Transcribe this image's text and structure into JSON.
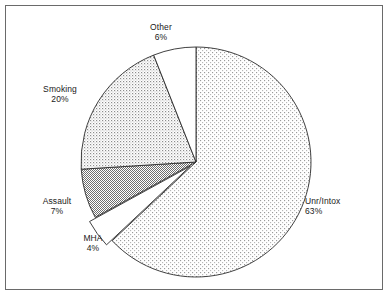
{
  "chart_data": {
    "type": "pie",
    "title": "",
    "subtitle": "",
    "xlabel": "",
    "ylabel": "",
    "legend_position": "none",
    "grid": false,
    "value_unit": "percent",
    "total": 100,
    "start_angle_deg": 0,
    "direction": "clockwise",
    "categories": [
      "Unr/Intox",
      "MHA",
      "Assault",
      "Smoking",
      "Other"
    ],
    "values": [
      63,
      4,
      7,
      20,
      6
    ],
    "slices": [
      {
        "label": "Unr/Intox",
        "value": 63,
        "value_text": "63%",
        "fill": "light-dot-stipple",
        "fill_color": "#ffffff",
        "pattern_color": "#8d8d8d",
        "exploded": false,
        "start_deg": 0,
        "end_deg": 226.8,
        "label_x": 305,
        "label_y": 196,
        "label_align": "left"
      },
      {
        "label": "MHA",
        "value": 4,
        "value_text": "4%",
        "fill": "solid-white",
        "fill_color": "#ffffff",
        "pattern_color": "#000000",
        "exploded": true,
        "explode_offset": 7,
        "start_deg": 226.8,
        "end_deg": 241.2,
        "label_x": 93,
        "label_y": 233,
        "label_align": "center"
      },
      {
        "label": "Assault",
        "value": 7,
        "value_text": "7%",
        "fill": "dense-gray-checker",
        "fill_color": "#ffffff",
        "pattern_color": "#6f6f6f",
        "exploded": false,
        "start_deg": 241.2,
        "end_deg": 266.4,
        "label_x": 57,
        "label_y": 196,
        "label_align": "center"
      },
      {
        "label": "Smoking",
        "value": 20,
        "value_text": "20%",
        "fill": "medium-dot-stipple",
        "fill_color": "#ffffff",
        "pattern_color": "#8d8d8d",
        "exploded": false,
        "start_deg": 266.4,
        "end_deg": 338.4,
        "label_x": 60,
        "label_y": 84,
        "label_align": "center"
      },
      {
        "label": "Other",
        "value": 6,
        "value_text": "6%",
        "fill": "solid-white",
        "fill_color": "#ffffff",
        "pattern_color": "#000000",
        "exploded": false,
        "start_deg": 338.4,
        "end_deg": 360,
        "label_x": 161,
        "label_y": 22,
        "label_align": "center"
      }
    ],
    "geometry": {
      "center_x": 196,
      "center_y": 162,
      "radius": 115
    },
    "frame": {
      "border_color": "#6a6a6a",
      "background": "#ffffff"
    }
  }
}
